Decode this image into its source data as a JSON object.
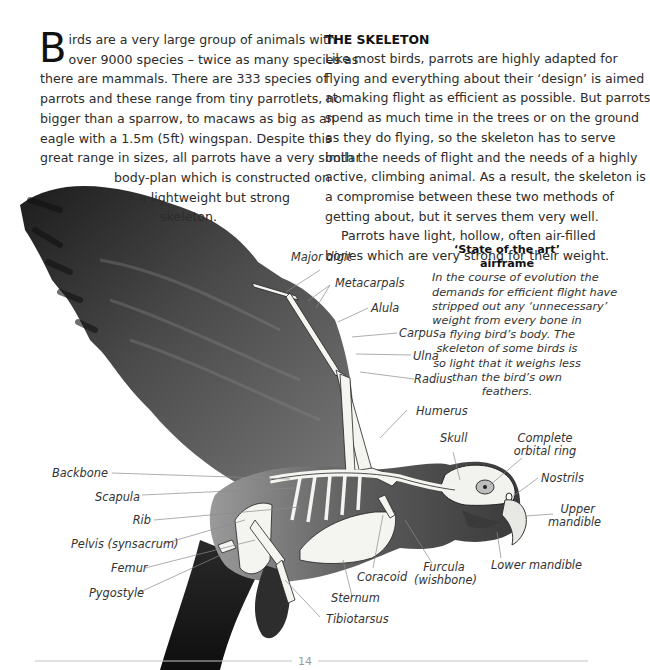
{
  "intro": {
    "dropcap": "B",
    "lines": [
      "irds are a very large group of animals with",
      "over 9000 species – twice as many species as",
      "there are mammals. There are 333 species of",
      "parrots and these range from tiny parrotlets, no",
      "bigger than a sparrow, to macaws as big as an",
      "eagle with a 1.5m (5ft) wingspan. Despite this",
      "great range in sizes, all parrots have a very similar",
      "body-plan which is constructed on",
      "a lightweight but strong",
      "skeleton."
    ]
  },
  "skeleton_section": {
    "heading": "THE SKELETON",
    "lines": [
      "Like most birds, parrots are highly adapted for",
      "flying and everything about their ‘design’ is aimed",
      "at making flight as efficient as possible. But parrots",
      "spend as much time in the trees or on the ground",
      "as they do flying, so the skeleton has to serve",
      "both the needs of flight and the needs of a highly",
      "active, climbing animal. As a result, the skeleton is",
      "a compromise between these two methods of",
      "getting about, but it serves them very well.",
      "Parrots have light, hollow, often air-filled",
      "bones which are very strong for their weight."
    ]
  },
  "sidebar": {
    "title": "‘State of the art’ airframe",
    "lines": [
      "In the course of evolution the",
      "demands for efficient flight have",
      "stripped out any ‘unnecessary’",
      "weight from every bone in",
      "a flying bird’s body. The",
      "skeleton of some birds is",
      "so light that it weighs less",
      "than the bird’s own",
      "feathers."
    ]
  },
  "labels": {
    "major_digit": "Major digit",
    "metacarpals": "Metacarpals",
    "alula": "Alula",
    "carpus": "Carpus",
    "ulna": "Ulna",
    "radius": "Radius",
    "humerus": "Humerus",
    "skull": "Skull",
    "orbital_ring_1": "Complete",
    "orbital_ring_2": "orbital ring",
    "nostrils": "Nostrils",
    "upper_mandible_1": "Upper",
    "upper_mandible_2": "mandible",
    "lower_mandible": "Lower mandible",
    "backbone": "Backbone",
    "scapula": "Scapula",
    "rib": "Rib",
    "pelvis": "Pelvis (synsacrum)",
    "femur": "Femur",
    "pygostyle": "Pygostyle",
    "coracoid": "Coracoid",
    "furcula_1": "Furcula",
    "furcula_2": "(wishbone)",
    "sternum": "Sternum",
    "tibiotarsus": "Tibiotarsus"
  },
  "footer": {
    "page_number": "14"
  },
  "colors": {
    "text": "#2c2c2c",
    "bird_dark": "#2e2e2e",
    "bird_mid": "#6e6e6e",
    "bone": "#f4f4f0",
    "rule": "#bdbdbd"
  }
}
